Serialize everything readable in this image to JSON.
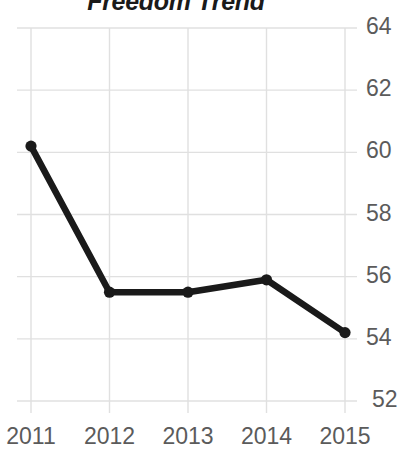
{
  "chart_data": {
    "type": "line",
    "title": "Freedom Trend",
    "xlabel": "",
    "ylabel": "",
    "categories": [
      "2011",
      "2012",
      "2013",
      "2014",
      "2015"
    ],
    "x": [
      2011,
      2012,
      2013,
      2014,
      2015
    ],
    "values": [
      60.2,
      55.5,
      55.5,
      55.9,
      54.2
    ],
    "series": [
      {
        "name": "Freedom Trend",
        "values": [
          60.2,
          55.5,
          55.5,
          55.9,
          54.2
        ]
      }
    ],
    "ylim": [
      51.2,
      64.6
    ],
    "yticks": [
      64,
      62,
      60,
      58,
      56,
      54,
      52
    ],
    "ytick_labels": [
      "64",
      "62",
      "60",
      "58",
      "56",
      "54",
      "52"
    ],
    "xtick_labels": [
      "2011",
      "2012",
      "2013",
      "2014",
      "2015"
    ],
    "grid": true,
    "y_axis_position": "right",
    "legend": "none",
    "line_color": "#1a1a1a",
    "marker_color": "#1a1a1a",
    "grid_color": "#e0e0e0",
    "tick_label_color": "#5b5b5b",
    "title_color": "#1a1a1a",
    "background_color": "#ffffff"
  }
}
